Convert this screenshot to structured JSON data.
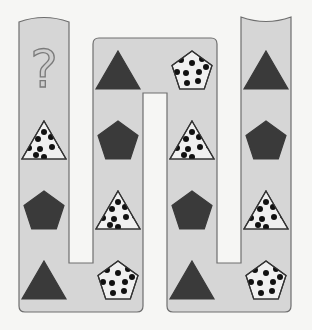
{
  "puzzle": {
    "question_mark": "?",
    "colors": {
      "path_fill": "#d6d6d6",
      "path_stroke": "#6e6e6e",
      "solid_shape": "#3a3a3a",
      "dotted_fill": "#f0f0f0",
      "dot": "#111111",
      "question_fill": "#cfcfcf",
      "question_stroke": "#7a7a7a"
    },
    "columns": [
      {
        "cells": [
          "question",
          "dotted-triangle",
          "solid-pentagon",
          "solid-triangle"
        ]
      },
      {
        "cells": [
          "solid-triangle",
          "solid-pentagon",
          "dotted-triangle",
          "dotted-pentagon"
        ]
      },
      {
        "cells": [
          "dotted-pentagon",
          "dotted-triangle",
          "solid-pentagon",
          "solid-triangle"
        ]
      },
      {
        "cells": [
          "solid-triangle",
          "solid-pentagon",
          "dotted-triangle",
          "dotted-pentagon"
        ]
      }
    ]
  }
}
